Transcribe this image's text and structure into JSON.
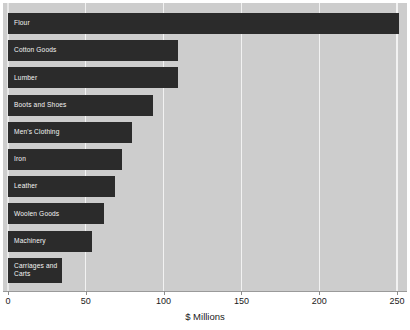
{
  "chart_data": {
    "type": "bar",
    "orientation": "horizontal",
    "title": "",
    "xlabel": "$ Millions",
    "ylabel": "",
    "xlim": [
      0,
      250
    ],
    "xticks": [
      0,
      50,
      100,
      150,
      200,
      250
    ],
    "xtick_labels": [
      "0",
      "50",
      "100",
      "150",
      "200",
      "250"
    ],
    "grid": true,
    "legend": null,
    "categories": [
      "Flour",
      "Cotton Goods",
      "Lumber",
      "Boots and Shoes",
      "Men's Clothing",
      "Iron",
      "Leather",
      "Woolen Goods",
      "Machinery",
      "Carriages and\nCarts"
    ],
    "values": [
      251,
      109,
      109,
      93,
      80,
      73,
      69,
      62,
      54,
      35
    ]
  },
  "colors": {
    "bar": "#2b2b2b",
    "plot_background": "#cdcdcd",
    "gridline": "#f2f2f2",
    "page_background": "#ffffff",
    "bar_label_text": "#f4f4f4",
    "axis_text": "#1a1a1a",
    "axis_line": "#9a9a9a"
  }
}
